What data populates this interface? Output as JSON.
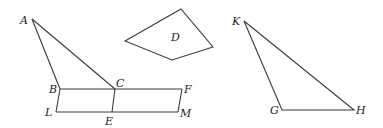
{
  "diagram": {
    "figures": [
      {
        "name": "triangle-ABC-with-parallelogram",
        "points": {
          "A": {
            "x": 32,
            "y": 19
          },
          "B": {
            "x": 60,
            "y": 89
          },
          "C": {
            "x": 115,
            "y": 89
          },
          "F": {
            "x": 182,
            "y": 89
          },
          "L": {
            "x": 56,
            "y": 112
          },
          "E": {
            "x": 112,
            "y": 112
          },
          "M": {
            "x": 178,
            "y": 112
          }
        },
        "segments": [
          "AB",
          "AC",
          "BF",
          "LM",
          "BL",
          "CE",
          "FM"
        ]
      },
      {
        "name": "quadrilateral-D",
        "vertices": [
          [
            125,
            41
          ],
          [
            181,
            9
          ],
          [
            213,
            47
          ],
          [
            172,
            60
          ]
        ],
        "label": "D"
      },
      {
        "name": "triangle-KGH",
        "points": {
          "K": {
            "x": 244,
            "y": 21
          },
          "G": {
            "x": 282,
            "y": 110
          },
          "H": {
            "x": 354,
            "y": 110
          }
        },
        "segments": [
          "KG",
          "GH",
          "HK"
        ]
      }
    ],
    "labels": {
      "A": "A",
      "B": "B",
      "C": "C",
      "F": "F",
      "L": "L",
      "E": "E",
      "M": "M",
      "D": "D",
      "K": "K",
      "G": "G",
      "H": "H"
    }
  }
}
